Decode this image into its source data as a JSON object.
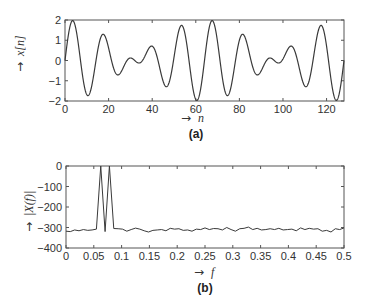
{
  "chart_data": [
    {
      "type": "line",
      "panel": "(a)",
      "title": "",
      "xlabel": "n",
      "ylabel": "x[n]",
      "xlim": [
        0,
        128
      ],
      "ylim": [
        -2,
        2
      ],
      "xticks": [
        0,
        20,
        40,
        60,
        80,
        100,
        120
      ],
      "yticks": [
        -2,
        -1,
        0,
        1,
        2
      ],
      "grid": false,
      "description": "Sum of two sinusoids with frequencies 0.0625 and 0.078125 cycles/sample, n = 0..128",
      "components": [
        {
          "amplitude": 1,
          "frequency": 0.0625,
          "phase": "sin"
        },
        {
          "amplitude": 1,
          "frequency": 0.078125,
          "phase": "sin"
        }
      ],
      "extrema_approx": [
        {
          "n": 4,
          "x": 1.95
        },
        {
          "n": 11,
          "x": -1.7
        },
        {
          "n": 18,
          "x": 1.25
        },
        {
          "n": 25,
          "x": -0.65
        },
        {
          "n": 30,
          "x": 0.1
        },
        {
          "n": 34,
          "x": -0.1
        },
        {
          "n": 40,
          "x": 0.7
        },
        {
          "n": 47,
          "x": -1.25
        },
        {
          "n": 54,
          "x": 1.7
        },
        {
          "n": 61,
          "x": -1.95
        },
        {
          "n": 68,
          "x": 1.95
        },
        {
          "n": 75,
          "x": -1.7
        },
        {
          "n": 82,
          "x": 1.25
        },
        {
          "n": 89,
          "x": -0.65
        },
        {
          "n": 94,
          "x": 0.1
        },
        {
          "n": 98,
          "x": -0.1
        },
        {
          "n": 104,
          "x": 0.7
        },
        {
          "n": 111,
          "x": -1.25
        },
        {
          "n": 118,
          "x": 1.7
        },
        {
          "n": 125,
          "x": -1.95
        }
      ]
    },
    {
      "type": "line",
      "panel": "(b)",
      "title": "",
      "xlabel": "f",
      "ylabel": "|X(f)|",
      "xlim": [
        0,
        0.5
      ],
      "ylim": [
        -400,
        0
      ],
      "xticks": [
        0,
        0.05,
        0.1,
        0.15,
        0.2,
        0.25,
        0.3,
        0.35,
        0.4,
        0.45,
        0.5
      ],
      "yticks": [
        -400,
        -300,
        -200,
        -100,
        0
      ],
      "grid": false,
      "x": [
        0,
        0.0078,
        0.0156,
        0.0234,
        0.0313,
        0.0391,
        0.0469,
        0.0547,
        0.0625,
        0.0703,
        0.0781,
        0.0859,
        0.0938,
        0.1016,
        0.1094,
        0.1172,
        0.125,
        0.1328,
        0.1406,
        0.1484,
        0.1563,
        0.1641,
        0.1719,
        0.1797,
        0.1875,
        0.1953,
        0.2031,
        0.2109,
        0.2188,
        0.2266,
        0.2344,
        0.2422,
        0.25,
        0.2578,
        0.2656,
        0.2734,
        0.2813,
        0.2891,
        0.2969,
        0.3047,
        0.3125,
        0.3203,
        0.3281,
        0.3359,
        0.3438,
        0.3516,
        0.3594,
        0.3672,
        0.375,
        0.3828,
        0.3906,
        0.3984,
        0.4063,
        0.4141,
        0.4219,
        0.4297,
        0.4375,
        0.4453,
        0.4531,
        0.4609,
        0.4688,
        0.4766,
        0.4844,
        0.4922,
        0.5
      ],
      "values": [
        -318,
        -320,
        -312,
        -316,
        -310,
        -314,
        -312,
        -308,
        0,
        -320,
        0,
        -305,
        -306,
        -308,
        -318,
        -310,
        -303,
        -308,
        -316,
        -322,
        -314,
        -312,
        -310,
        -316,
        -304,
        -308,
        -306,
        -314,
        -312,
        -318,
        -308,
        -310,
        -302,
        -310,
        -305,
        -306,
        -312,
        -300,
        -310,
        -318,
        -306,
        -304,
        -298,
        -310,
        -304,
        -312,
        -310,
        -306,
        -310,
        -304,
        -312,
        -310,
        -308,
        -316,
        -302,
        -310,
        -304,
        -308,
        -306,
        -318,
        -314,
        -322,
        -306,
        -310,
        -302
      ]
    }
  ],
  "panel_a": {
    "ylabel_prefix": "→",
    "ylabel": "x[n]",
    "xlabel_prefix": "→",
    "xlabel": "n",
    "caption": "(a)",
    "yticks": [
      "2",
      "1",
      "0",
      "−1",
      "−2"
    ],
    "xticks": [
      "0",
      "20",
      "40",
      "60",
      "80",
      "100",
      "120"
    ]
  },
  "panel_b": {
    "ylabel": "|X(f)|",
    "xlabel": "f",
    "caption": "(b)",
    "yticks": [
      "0",
      "−100",
      "−200",
      "−300",
      "−400"
    ],
    "xticks": [
      "0",
      "0.05",
      "0.1",
      "0.15",
      "0.2",
      "0.25",
      "0.3",
      "0.35",
      "0.4",
      "0.45",
      "0.5"
    ]
  },
  "colors": {
    "line": "#3a3a3a",
    "axis": "#555555",
    "text": "#333333"
  }
}
